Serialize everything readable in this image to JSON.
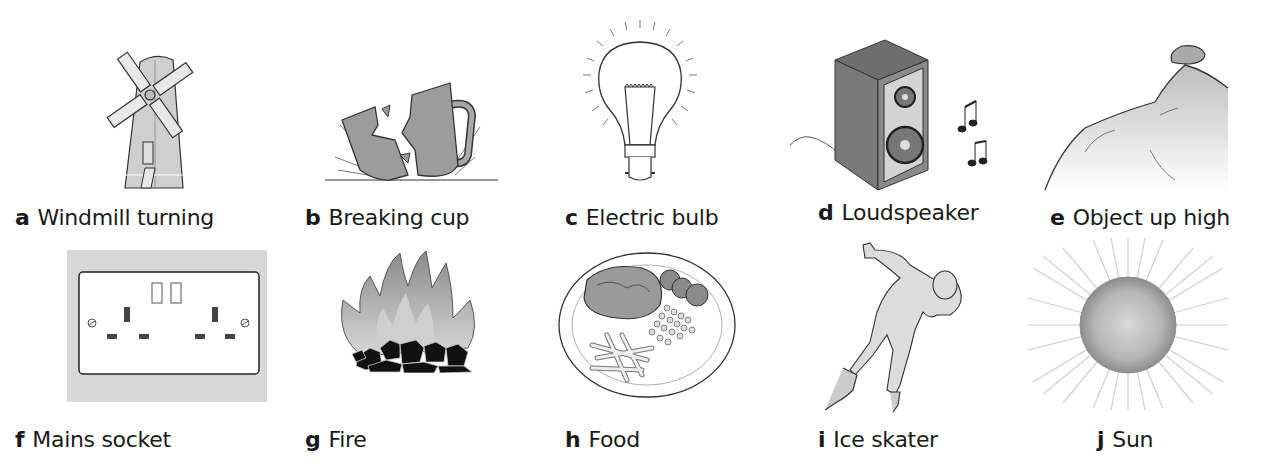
{
  "figure": {
    "title": "",
    "items": [
      {
        "letter": "a",
        "label": "Windmill turning",
        "icon": "windmill-icon"
      },
      {
        "letter": "b",
        "label": "Breaking cup",
        "icon": "breaking-cup-icon"
      },
      {
        "letter": "c",
        "label": "Electric bulb",
        "icon": "light-bulb-icon"
      },
      {
        "letter": "d",
        "label": "Loudspeaker",
        "icon": "loudspeaker-icon"
      },
      {
        "letter": "e",
        "label": "Object up high",
        "icon": "rock-on-cliff-icon"
      },
      {
        "letter": "f",
        "label": "Mains socket",
        "icon": "power-socket-icon"
      },
      {
        "letter": "g",
        "label": "Fire",
        "icon": "fire-icon"
      },
      {
        "letter": "h",
        "label": "Food",
        "icon": "food-plate-icon"
      },
      {
        "letter": "i",
        "label": "Ice skater",
        "icon": "ice-skater-icon"
      },
      {
        "letter": "j",
        "label": "Sun",
        "icon": "sun-icon"
      }
    ]
  },
  "colors": {
    "ink": "#1a1a1a",
    "fill_light": "#cfcfcf",
    "fill_mid": "#9a9a9a",
    "fill_dark": "#555555",
    "socket_bg": "#d8d8d8"
  }
}
